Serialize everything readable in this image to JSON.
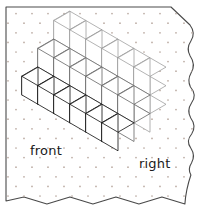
{
  "page": {
    "background_color": "#ffffff",
    "width": 199,
    "height": 211
  },
  "paper": {
    "name": "torn-dot-paper",
    "fill": "#ffffff",
    "edge_color": "#4a4a4a",
    "edge_width": 1.1,
    "edges": {
      "top": "straight",
      "left": "straight",
      "right": "wavy-torn",
      "bottom": "zigzag-torn",
      "top_right_corner": "cut-diagonal"
    },
    "dot_grid": {
      "name": "isometric-dot-grid",
      "color": "#b9a9a0",
      "radius": 0.85,
      "x_spacing": 16,
      "y_spacing": 9.6,
      "stagger": true
    }
  },
  "figure": {
    "name": "isometric-cube-staircase",
    "type": "isometric-cube-stack",
    "cube_edge_px": 16,
    "origin": {
      "x": 22,
      "y": 95
    },
    "axes": {
      "right_dx": 16,
      "right_dy": 9.3,
      "front_dx": 16,
      "front_dy": -9.3,
      "up_dx": 0,
      "up_dy": -18.6
    },
    "dimensions": {
      "width_cubes": 6,
      "depth_cubes": 3,
      "height_cubes": 3
    },
    "heights_by_depth_row": [
      3,
      2,
      1
    ],
    "total_cubes": 36,
    "colors": {
      "face_fill": "#ffffff",
      "edge_dark": "#1a1a1a",
      "edge_light": "#9a9a9a",
      "edge_mid": "#6e6e6e"
    }
  },
  "labels": {
    "front": "front",
    "right": "right"
  }
}
